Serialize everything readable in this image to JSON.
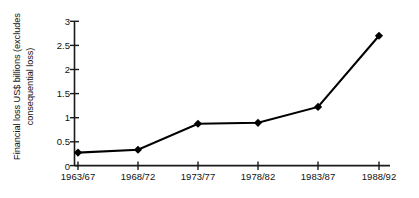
{
  "chart_data": {
    "type": "line",
    "title": "",
    "subtitle": "",
    "xlabel": "",
    "ylabel": "Financial loss US$ billions (excludes consequential loss)",
    "ylabel_lines": [
      "Financial loss US$ billions (excludes",
      "consequential loss)"
    ],
    "categories": [
      "1963/67",
      "1968/72",
      "1973/77",
      "1978/82",
      "1983/87",
      "1988/92"
    ],
    "values": [
      0.27,
      0.33,
      0.87,
      0.89,
      1.22,
      2.7
    ],
    "series": [
      {
        "name": "Financial loss",
        "values": [
          0.27,
          0.33,
          0.87,
          0.89,
          1.22,
          2.7
        ]
      }
    ],
    "ylim": [
      0,
      3
    ],
    "yticks": [
      0,
      0.5,
      1,
      1.5,
      2,
      2.5,
      3
    ],
    "ytick_labels": [
      "0",
      "0.5",
      "1",
      "1.5",
      "2",
      "2.5",
      "3"
    ],
    "xtick_labels": [
      "1963/67",
      "1968/72",
      "1973/77",
      "1978/82",
      "1983/87",
      "1988/92"
    ],
    "grid": false,
    "legend": false,
    "legend_position": "none",
    "marker": "diamond",
    "line_color": "#000000",
    "marker_color": "#000000",
    "axis_color": "#1a1a1a",
    "background_color": "#ffffff"
  }
}
